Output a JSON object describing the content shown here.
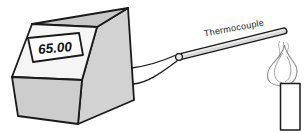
{
  "meter": {
    "display_value": "65.00"
  },
  "probe": {
    "label": "Thermocouple"
  },
  "colors": {
    "outline": "#1a1a1a",
    "box_top": "#c8c8c8",
    "box_side": "#d2d2d2",
    "box_front": "#cdcdcd",
    "panel": "#f5f5f5",
    "display_bg": "#ffffff",
    "rod_fill": "#d8d8d8",
    "connector_fill": "#ececec",
    "flame_stroke": "#8c8c8c",
    "burner_fill": "#ffffff"
  }
}
